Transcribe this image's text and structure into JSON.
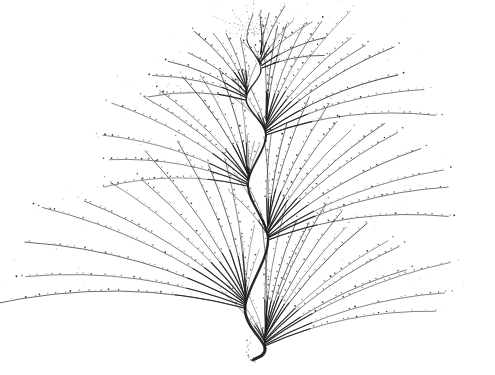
{
  "figure": {
    "type": "generative-fractal-plant",
    "background_color": "#ffffff",
    "ink_color": "#1c1c1c",
    "dot_color": "#141414",
    "canvas": {
      "width": 495,
      "height": 375
    },
    "seed": 11,
    "stem": {
      "points": [
        [
          253,
          14
        ],
        [
          247,
          40
        ],
        [
          261,
          70
        ],
        [
          246,
          100
        ],
        [
          266,
          136
        ],
        [
          248,
          186
        ],
        [
          268,
          241
        ],
        [
          245,
          308
        ],
        [
          265,
          348
        ],
        [
          253,
          360
        ]
      ],
      "width_top": 0.7,
      "width_bottom": 3.0
    },
    "apex": {
      "x": 251,
      "y": 36,
      "rays": 12,
      "r_min": 16,
      "r_max": 44
    },
    "fans": [
      {
        "x": 261,
        "y": 70,
        "side": "right",
        "radius": 75,
        "rays": 7,
        "a0": -94,
        "a1": -10
      },
      {
        "x": 246,
        "y": 100,
        "side": "left",
        "radius": 95,
        "rays": 8,
        "a0": -178,
        "a1": -98
      },
      {
        "x": 266,
        "y": 136,
        "side": "right",
        "radius": 175,
        "rays": 12,
        "a0": -93,
        "a1": -8
      },
      {
        "x": 248,
        "y": 186,
        "side": "left",
        "radius": 160,
        "rays": 10,
        "a0": -179,
        "a1": -97
      },
      {
        "x": 268,
        "y": 241,
        "side": "right",
        "radius": 195,
        "rays": 13,
        "a0": -93,
        "a1": -8
      },
      {
        "x": 245,
        "y": 308,
        "side": "left",
        "radius": 230,
        "rays": 11,
        "a0": -180,
        "a1": -98
      },
      {
        "x": 265,
        "y": 348,
        "side": "right",
        "radius": 205,
        "rays": 15,
        "a0": -92,
        "a1": -12
      }
    ],
    "back_rays": {
      "count": 3,
      "radius_factor": 0.3
    },
    "tail": {
      "x": 247,
      "y": 336,
      "dots": 10
    },
    "dot_spacing": 7
  }
}
